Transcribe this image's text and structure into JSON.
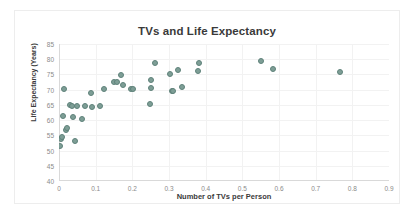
{
  "chart_data": {
    "type": "scatter",
    "title": "TVs and Life Expectancy",
    "xlabel": "Number of TVs per Person",
    "ylabel": "Life Expectancy (Years)",
    "xlim": [
      0,
      0.9
    ],
    "ylim": [
      40,
      85
    ],
    "xticks": [
      "0",
      "0.1",
      "0.2",
      "0.3",
      "0.4",
      "0.5",
      "0.6",
      "0.7",
      "0.8",
      "0.9"
    ],
    "yticks": [
      "40",
      "45",
      "50",
      "55",
      "60",
      "65",
      "70",
      "75",
      "80",
      "85"
    ],
    "grid": true,
    "legend": "none",
    "series": [
      {
        "name": "Countries",
        "marker_color": "#7e9e96",
        "marker_edge_color": "#5f827a",
        "points": [
          {
            "x": 0.004,
            "y": 51.4
          },
          {
            "x": 0.006,
            "y": 53.8
          },
          {
            "x": 0.007,
            "y": 54.5
          },
          {
            "x": 0.012,
            "y": 61.2
          },
          {
            "x": 0.014,
            "y": 70.1
          },
          {
            "x": 0.018,
            "y": 56.7
          },
          {
            "x": 0.022,
            "y": 57.4
          },
          {
            "x": 0.03,
            "y": 64.9
          },
          {
            "x": 0.035,
            "y": 64.7
          },
          {
            "x": 0.038,
            "y": 61.1
          },
          {
            "x": 0.044,
            "y": 53.1
          },
          {
            "x": 0.05,
            "y": 64.6
          },
          {
            "x": 0.062,
            "y": 60.5
          },
          {
            "x": 0.07,
            "y": 64.6
          },
          {
            "x": 0.086,
            "y": 68.8
          },
          {
            "x": 0.09,
            "y": 64.2
          },
          {
            "x": 0.112,
            "y": 64.6
          },
          {
            "x": 0.122,
            "y": 70.2
          },
          {
            "x": 0.15,
            "y": 72.4
          },
          {
            "x": 0.158,
            "y": 72.4
          },
          {
            "x": 0.17,
            "y": 74.7
          },
          {
            "x": 0.175,
            "y": 71.6
          },
          {
            "x": 0.196,
            "y": 70.2
          },
          {
            "x": 0.203,
            "y": 70.1
          },
          {
            "x": 0.248,
            "y": 65.2
          },
          {
            "x": 0.25,
            "y": 70.7
          },
          {
            "x": 0.252,
            "y": 73.3
          },
          {
            "x": 0.262,
            "y": 78.7
          },
          {
            "x": 0.302,
            "y": 75.0
          },
          {
            "x": 0.308,
            "y": 69.4
          },
          {
            "x": 0.312,
            "y": 69.7
          },
          {
            "x": 0.325,
            "y": 76.3
          },
          {
            "x": 0.335,
            "y": 70.8
          },
          {
            "x": 0.38,
            "y": 76.1
          },
          {
            "x": 0.382,
            "y": 78.6
          },
          {
            "x": 0.552,
            "y": 79.3
          },
          {
            "x": 0.583,
            "y": 76.9
          },
          {
            "x": 0.766,
            "y": 75.8
          }
        ]
      }
    ]
  }
}
